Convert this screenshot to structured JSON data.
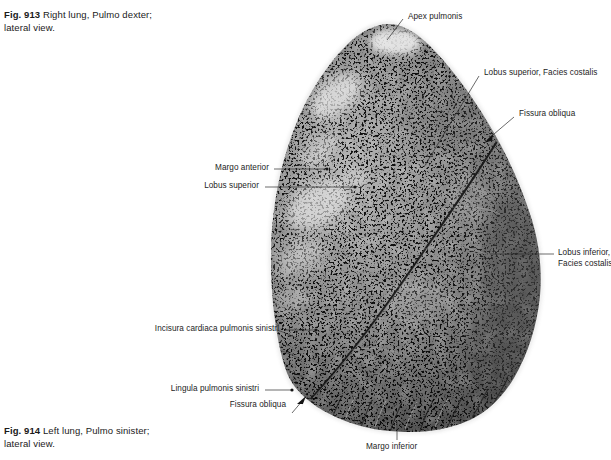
{
  "plate": {
    "width": 611,
    "height": 460,
    "background": "#ffffff"
  },
  "captions": {
    "top": {
      "fig_number": "Fig. 913",
      "line1": "Right lung, Pulmo dexter;",
      "line2": "lateral view."
    },
    "bottom": {
      "fig_number": "Fig. 914",
      "line1": "Left lung, Pulmo sinister;",
      "line2": "lateral view."
    }
  },
  "labels": {
    "apex_pulmonis": "Apex pulmonis",
    "lobus_superior_facies_costalis": "Lobus superior, Facies costalis",
    "fissura_obliqua_right": "Fissura obliqua",
    "lobus_inferior_facies_costalis_line1": "Lobus inferior,",
    "lobus_inferior_facies_costalis_line2": "Facies costalis",
    "margo_anterior": "Margo anterior",
    "lobus_superior": "Lobus superior",
    "incisura_cardiaca": "Incisura cardiaca pulmonis sinistri",
    "lingula": "Lingula pulmonis sinistri",
    "fissura_obliqua_bottom": "Fissura obliqua",
    "margo_inferior": "Margo inferior"
  },
  "figure": {
    "view": "lateral",
    "rendering": "grayscale-photograph",
    "colors": {
      "text": "#1a1a1a",
      "leader_line": "#2b2b2b",
      "tissue_mid": "#8a8a8a",
      "tissue_light": "#d8d8d8",
      "tissue_dark": "#3a3a3a",
      "fissure_line": "#1c1c1c",
      "background": "#ffffff"
    }
  }
}
